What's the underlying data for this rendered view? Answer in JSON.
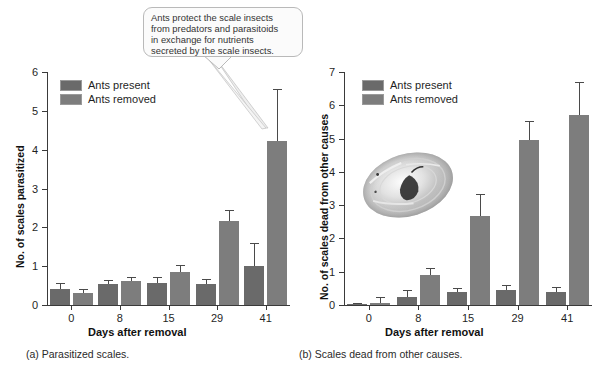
{
  "figure": {
    "callout": {
      "text": "Ants protect the scale insects\nfrom predators and parasitoids\nin exchange for nutrients\nsecreted by the scale insects."
    },
    "photo_alt": "scale-insect-photo"
  },
  "legend": {
    "present_label": "Ants present",
    "removed_label": "Ants removed",
    "present_color": "#6a6a6a",
    "removed_color": "#7d7d7d"
  },
  "panel_a": {
    "caption": "(a) Parasitized scales.",
    "chart_data": {
      "type": "bar",
      "title": "",
      "xlabel": "Days after removal",
      "ylabel": "No. of scales parasitized",
      "categories": [
        "0",
        "8",
        "15",
        "29",
        "41"
      ],
      "ylim": [
        0,
        6
      ],
      "yticks": [
        0,
        1,
        2,
        3,
        4,
        5,
        6
      ],
      "grid": false,
      "legend_position": "top-left",
      "series": [
        {
          "name": "Ants present",
          "values": [
            0.42,
            0.55,
            0.56,
            0.54,
            1.0
          ],
          "errors": [
            0.15,
            0.1,
            0.15,
            0.14,
            0.6
          ]
        },
        {
          "name": "Ants removed",
          "values": [
            0.3,
            0.61,
            0.85,
            2.16,
            4.22
          ],
          "errors": [
            0.12,
            0.12,
            0.17,
            0.29,
            1.33
          ]
        }
      ]
    }
  },
  "panel_b": {
    "caption": "(b) Scales dead from other causes.",
    "chart_data": {
      "type": "bar",
      "title": "",
      "xlabel": "Days after removal",
      "ylabel": "No. of scales dead from other causes",
      "categories": [
        "0",
        "8",
        "15",
        "29",
        "41"
      ],
      "ylim": [
        0,
        7
      ],
      "yticks": [
        0,
        1,
        2,
        3,
        4,
        5,
        6,
        7
      ],
      "grid": false,
      "legend_position": "top-left",
      "series": [
        {
          "name": "Ants present",
          "values": [
            0.03,
            0.24,
            0.38,
            0.45,
            0.38
          ],
          "errors": [
            0.02,
            0.2,
            0.13,
            0.16,
            0.15
          ]
        },
        {
          "name": "Ants removed",
          "values": [
            0.05,
            0.9,
            2.68,
            4.95,
            5.7
          ],
          "errors": [
            0.2,
            0.21,
            0.66,
            0.58,
            1.0
          ]
        }
      ]
    }
  }
}
